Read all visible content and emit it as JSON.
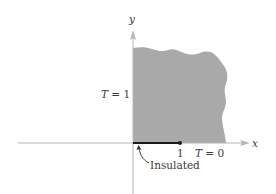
{
  "diagram": {
    "axes": {
      "x_label": "x",
      "y_label": "y",
      "axis_color": "#b5b5b5"
    },
    "region": {
      "fill_color": "#a9a9a9",
      "description": "shaded quarter-plane region x>0, y>0 with irregular (unbounded) top and right edges"
    },
    "segment": {
      "color": "#1a1a1a",
      "from": 0,
      "to": 1,
      "end_tick_label": "1"
    },
    "labels": {
      "left_boundary": "T = 1",
      "bottom_right_boundary": "T = 0",
      "insulated": "Insulated"
    }
  }
}
